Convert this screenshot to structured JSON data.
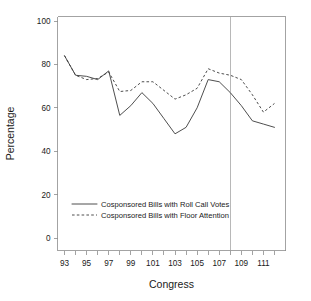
{
  "chart_data": {
    "type": "line",
    "title": "",
    "xlabel": "Congress",
    "ylabel": "Percentage",
    "x": [
      93,
      94,
      95,
      96,
      97,
      98,
      99,
      100,
      101,
      102,
      103,
      104,
      105,
      106,
      107,
      108,
      109,
      110,
      111,
      112
    ],
    "xlim": [
      92.5,
      112.5
    ],
    "ylim": [
      0,
      100
    ],
    "yticks": [
      0,
      20,
      40,
      60,
      80,
      100
    ],
    "ytick_labels": [
      "0",
      "20",
      "40",
      "60",
      "80",
      "100"
    ],
    "xticks": [
      93,
      94,
      95,
      96,
      97,
      98,
      99,
      100,
      101,
      102,
      103,
      104,
      105,
      106,
      107,
      108,
      109,
      110,
      111,
      112
    ],
    "xtick_labels": [
      "93",
      "",
      "95",
      "",
      "97",
      "",
      "99",
      "",
      "101",
      "",
      "103",
      "",
      "105",
      "",
      "107",
      "",
      "109",
      "",
      "111",
      ""
    ],
    "grid": false,
    "legend_position": "center-bottom-left",
    "annotations": [
      {
        "type": "vertical-line",
        "x": 108,
        "style": "solid-gray",
        "name": "reference-line-congress-108"
      }
    ],
    "series": [
      {
        "name": "Cosponsored Bills with Roll Call Votes",
        "style": "solid",
        "values": [
          84,
          75,
          74.5,
          73,
          77,
          56.5,
          61,
          67,
          62,
          55,
          48,
          51,
          60,
          73,
          72,
          67,
          61,
          54,
          52.5,
          51
        ]
      },
      {
        "name": "Cosponsored Bills with Floor Attention",
        "style": "dashed",
        "values": [
          84,
          75,
          73,
          73.5,
          76.5,
          67.5,
          68,
          72,
          72,
          68,
          64,
          66,
          69,
          78,
          76,
          75,
          73,
          66,
          58,
          62
        ]
      }
    ]
  },
  "legend": {
    "entries": [
      {
        "label": "Cosponsored Bills with Roll Call Votes",
        "style": "solid"
      },
      {
        "label": "Cosponsored Bills with Floor Attention",
        "style": "dashed"
      }
    ]
  },
  "colors": {
    "line": "#3a3a3a",
    "axis": "#8c8c8c",
    "reference": "#9a9a9a",
    "background": "#ffffff",
    "text": "#1a1a1a"
  }
}
